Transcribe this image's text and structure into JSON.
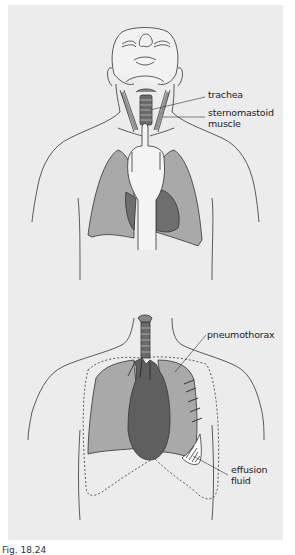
{
  "figure": {
    "top_panel": {
      "description": "Palpation of trachea position in the suprasternal notch",
      "labels": {
        "trachea": "trachea",
        "sternomastoid_line1": "sternomastoid",
        "sternomastoid_line2": "muscle"
      }
    },
    "bottom_panel": {
      "description": "Tracheal deviation with pneumothorax and pleural effusion",
      "labels": {
        "pneumothorax": "pneumothorax",
        "effusion_line1": "effusion",
        "effusion_line2": "fluid"
      }
    },
    "caption": "Fig. 18.24"
  },
  "colors": {
    "background_panel": "#ececec",
    "lung_light": "#a9a9a9",
    "lung_dark": "#6e6e6e",
    "heart": "#5f5f5f",
    "line": "#333333"
  }
}
